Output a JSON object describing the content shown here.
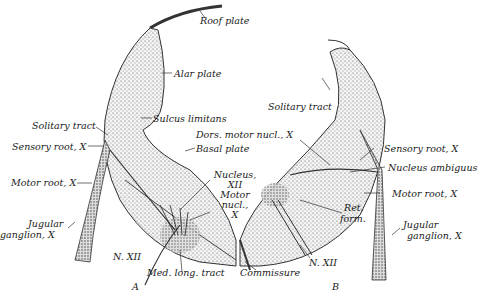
{
  "figure": {
    "panels": [
      {
        "id": "A",
        "label": "A"
      },
      {
        "id": "B",
        "label": "B"
      }
    ],
    "labels": {
      "roof_plate": "Roof plate",
      "alar_plate": "Alar plate",
      "sulcus_limitans": "Sulcus limitans",
      "solitary_tract_a": "Solitary tract",
      "sensory_root_a": "Sensory root, X",
      "motor_root_a": "Motor root, X",
      "jugular_a_1": "Jugular",
      "jugular_a_2": "ganglion, X",
      "n_xii_a": "N. XII",
      "med_long_tract": "Med. long. tract",
      "basal_plate": "Basal plate",
      "nucleus_xii_1": "Nucleus,",
      "nucleus_xii_2": "XII",
      "motor_nucl_1": "Motor",
      "motor_nucl_2": "nucl.,",
      "motor_nucl_3": "X",
      "dors_motor_nucl": "Dors. motor nucl., X",
      "solitary_tract_b": "Solitary tract",
      "sensory_root_b": "Sensory root, X",
      "nucleus_ambiguus": "Nucleus ambiguus",
      "motor_root_b": "Motor root, X",
      "ret_form_1": "Ret.",
      "ret_form_2": "form.",
      "jugular_b_1": "Jugular",
      "jugular_b_2": "ganglion, X",
      "n_xii_b": "N. XII",
      "commissure": "Commissure"
    }
  }
}
